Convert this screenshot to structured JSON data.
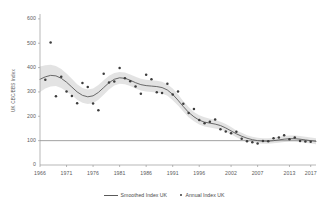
{
  "chart_data": {
    "type": "line",
    "title": "",
    "xlabel": "",
    "ylabel": "UK CBC/BBS Index",
    "xlim": [
      1966,
      2018
    ],
    "ylim": [
      0,
      620
    ],
    "yticks": [
      100,
      200,
      300,
      400,
      500,
      600
    ],
    "y_zero_label": "0",
    "xticks": [
      1966,
      1971,
      1976,
      1981,
      1986,
      1991,
      1996,
      2002,
      2007,
      2013,
      2017
    ],
    "grid": false,
    "legend_position": "bottom-center",
    "reference_line": 100,
    "colors": {
      "line": "#5a5a5a",
      "points": "#3c3c3c",
      "band": "#e2e2e2",
      "axis": "#9a9a9a",
      "text": "#5b5b5b"
    },
    "series": [
      {
        "name": "Smoothed Index UK",
        "type": "line",
        "x": [
          1966,
          1967,
          1968,
          1969,
          1970,
          1971,
          1972,
          1973,
          1974,
          1975,
          1976,
          1977,
          1978,
          1979,
          1980,
          1981,
          1982,
          1983,
          1984,
          1985,
          1986,
          1987,
          1988,
          1989,
          1990,
          1991,
          1992,
          1993,
          1994,
          1995,
          1996,
          1997,
          1998,
          1999,
          2000,
          2001,
          2002,
          2003,
          2004,
          2005,
          2006,
          2007,
          2008,
          2009,
          2010,
          2011,
          2012,
          2013,
          2014,
          2015,
          2016,
          2017,
          2018
        ],
        "values": [
          352,
          362,
          368,
          366,
          356,
          340,
          320,
          300,
          286,
          280,
          284,
          298,
          318,
          338,
          352,
          358,
          356,
          348,
          338,
          330,
          326,
          324,
          322,
          318,
          308,
          290,
          266,
          240,
          216,
          198,
          184,
          176,
          172,
          168,
          162,
          152,
          140,
          128,
          118,
          110,
          104,
          100,
          98,
          98,
          100,
          103,
          106,
          108,
          108,
          106,
          103,
          100,
          97
        ]
      },
      {
        "name": "Smoothed Index UK (upper confidence band)",
        "type": "band-upper",
        "x": [
          1966,
          1967,
          1968,
          1969,
          1970,
          1971,
          1972,
          1973,
          1974,
          1975,
          1976,
          1977,
          1978,
          1979,
          1980,
          1981,
          1982,
          1983,
          1984,
          1985,
          1986,
          1987,
          1988,
          1989,
          1990,
          1991,
          1992,
          1993,
          1994,
          1995,
          1996,
          1997,
          1998,
          1999,
          2000,
          2001,
          2002,
          2003,
          2004,
          2005,
          2006,
          2007,
          2008,
          2009,
          2010,
          2011,
          2012,
          2013,
          2014,
          2015,
          2016,
          2017,
          2018
        ],
        "values": [
          404,
          410,
          412,
          406,
          394,
          376,
          354,
          332,
          316,
          310,
          314,
          328,
          348,
          366,
          378,
          382,
          380,
          372,
          362,
          354,
          350,
          348,
          346,
          342,
          332,
          314,
          290,
          262,
          238,
          218,
          204,
          196,
          190,
          186,
          178,
          168,
          156,
          142,
          132,
          122,
          116,
          112,
          110,
          110,
          112,
          116,
          119,
          121,
          121,
          119,
          116,
          113,
          110
        ]
      },
      {
        "name": "Smoothed Index UK (lower confidence band)",
        "type": "band-lower",
        "x": [
          1966,
          1967,
          1968,
          1969,
          1970,
          1971,
          1972,
          1973,
          1974,
          1975,
          1976,
          1977,
          1978,
          1979,
          1980,
          1981,
          1982,
          1983,
          1984,
          1985,
          1986,
          1987,
          1988,
          1989,
          1990,
          1991,
          1992,
          1993,
          1994,
          1995,
          1996,
          1997,
          1998,
          1999,
          2000,
          2001,
          2002,
          2003,
          2004,
          2005,
          2006,
          2007,
          2008,
          2009,
          2010,
          2011,
          2012,
          2013,
          2014,
          2015,
          2016,
          2017,
          2018
        ],
        "values": [
          300,
          314,
          322,
          324,
          316,
          302,
          286,
          268,
          256,
          250,
          254,
          268,
          288,
          310,
          326,
          334,
          332,
          324,
          314,
          306,
          302,
          300,
          298,
          294,
          284,
          266,
          244,
          220,
          196,
          180,
          166,
          158,
          154,
          150,
          146,
          138,
          126,
          114,
          104,
          98,
          93,
          89,
          87,
          87,
          89,
          91,
          94,
          96,
          96,
          94,
          91,
          88,
          85
        ]
      },
      {
        "name": "Annual Index UK",
        "type": "scatter",
        "x": [
          1967,
          1968,
          1969,
          1970,
          1971,
          1972,
          1973,
          1974,
          1975,
          1976,
          1977,
          1978,
          1979,
          1980,
          1981,
          1982,
          1983,
          1984,
          1985,
          1986,
          1987,
          1988,
          1989,
          1990,
          1991,
          1992,
          1993,
          1994,
          1995,
          1996,
          1997,
          1998,
          1999,
          2000,
          2001,
          2002,
          2003,
          2004,
          2005,
          2006,
          2007,
          2008,
          2009,
          2010,
          2011,
          2012,
          2013,
          2014,
          2015,
          2016,
          2017
        ],
        "values": [
          350,
          503,
          282,
          362,
          302,
          283,
          254,
          337,
          320,
          253,
          225,
          375,
          339,
          343,
          398,
          356,
          344,
          322,
          293,
          371,
          352,
          299,
          296,
          334,
          289,
          302,
          252,
          213,
          230,
          185,
          171,
          178,
          187,
          147,
          138,
          130,
          137,
          108,
          98,
          93,
          88,
          99,
          98,
          110,
          113,
          122,
          106,
          113,
          99,
          97,
          95
        ]
      }
    ]
  },
  "legend": {
    "items": [
      {
        "label": "Smoothed Index UK",
        "marker": "line"
      },
      {
        "label": "Annual Index UK",
        "marker": "dot"
      }
    ]
  }
}
